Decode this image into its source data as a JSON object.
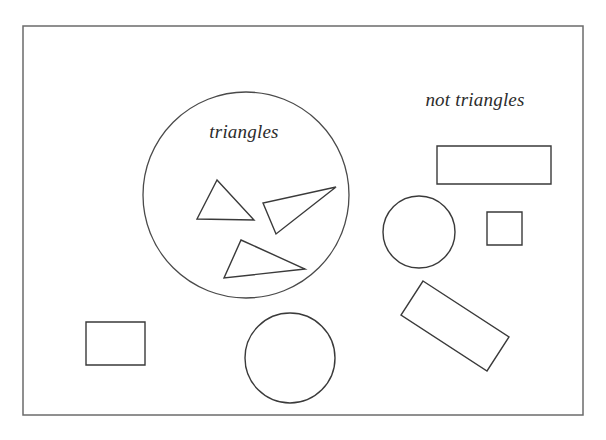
{
  "figure": {
    "background_color": "#ffffff",
    "stroke_color": "#3a3a3a",
    "frame_color": "#6b6b6b",
    "label_color": "#2c2c2c",
    "width": 606,
    "height": 440
  },
  "frame": {
    "name": "universe-frame",
    "x": 23,
    "y": 26,
    "width": 560,
    "height": 389
  },
  "labels": {
    "inside_set": "triangles",
    "outside_set": "not triangles",
    "inside_set_x": 244,
    "inside_set_y": 138,
    "outside_set_x": 475,
    "outside_set_y": 106
  },
  "set_circle": {
    "name": "triangles-set-boundary",
    "cx": 246,
    "cy": 195,
    "r": 103
  },
  "members": [
    {
      "name": "triangle-upper-left",
      "type": "triangle",
      "inside_set": true,
      "points": "217,180 197,219 254,220"
    },
    {
      "name": "triangle-right-sliver",
      "type": "triangle",
      "inside_set": true,
      "points": "336,187 263,203 276,234"
    },
    {
      "name": "triangle-lower-wide",
      "type": "triangle",
      "inside_set": true,
      "points": "241,240 305,269 224,278"
    }
  ],
  "non_members": [
    {
      "name": "rectangle-wide-top-right",
      "type": "rectangle",
      "inside_set": false,
      "points": "437,146 551,146 551,184 437,184"
    },
    {
      "name": "circle-right-medium",
      "type": "circle",
      "inside_set": false,
      "cx": 419,
      "cy": 232,
      "r": 36
    },
    {
      "name": "square-small-right",
      "type": "square",
      "inside_set": false,
      "points": "487,212 522,212 522,245 487,245"
    },
    {
      "name": "rectangle-tilted",
      "type": "rectangle",
      "inside_set": false,
      "points": "423,281 509,337 487,371 401,315"
    },
    {
      "name": "rectangle-bottom-left",
      "type": "rectangle",
      "inside_set": false,
      "points": "86,322 145,322 145,365 86,365"
    },
    {
      "name": "circle-bottom-center",
      "type": "circle",
      "inside_set": false,
      "cx": 290,
      "cy": 358,
      "r": 45
    }
  ]
}
